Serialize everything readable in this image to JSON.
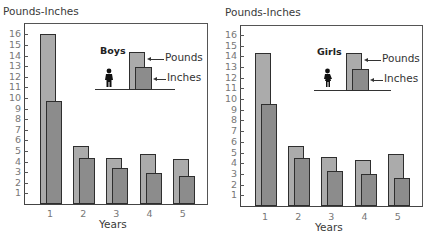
{
  "colors": {
    "pounds": "#ababab",
    "inches": "#8c8c8c",
    "outline": "#2e2e2e"
  },
  "chart_data": [
    {
      "type": "bar",
      "title": "Boys",
      "ylabel": "Pounds-Inches",
      "xlabel": "Years",
      "categories": [
        "1",
        "2",
        "3",
        "4",
        "5"
      ],
      "yticks": [
        1,
        2,
        3,
        4,
        5,
        6,
        7,
        8,
        9,
        10,
        11,
        12,
        13,
        14,
        15,
        16
      ],
      "ylim": [
        0,
        16.6
      ],
      "grid": false,
      "legend_position": "inset top-right",
      "series": [
        {
          "name": "Pounds",
          "values": [
            16.0,
            5.5,
            4.3,
            4.7,
            4.2
          ]
        },
        {
          "name": "Inches",
          "values": [
            9.7,
            4.3,
            3.4,
            2.9,
            2.6
          ]
        }
      ]
    },
    {
      "type": "bar",
      "title": "Girls",
      "ylabel": "Pounds-Inches",
      "xlabel": "Years",
      "categories": [
        "1",
        "2",
        "3",
        "4",
        "5"
      ],
      "yticks": [
        1,
        2,
        3,
        4,
        5,
        6,
        7,
        8,
        9,
        10,
        11,
        12,
        13,
        14,
        15,
        16
      ],
      "ylim": [
        0,
        16.6
      ],
      "grid": false,
      "legend_position": "inset top-right",
      "series": [
        {
          "name": "Pounds",
          "values": [
            14.3,
            5.6,
            4.6,
            4.3,
            4.9
          ]
        },
        {
          "name": "Inches",
          "values": [
            9.5,
            4.5,
            3.3,
            3.0,
            2.6
          ]
        }
      ]
    }
  ],
  "panels": [
    {
      "ylabel": "Pounds-Inches",
      "xlabel": "Years",
      "legend": {
        "title": "Boys",
        "pounds_label": "Pounds",
        "inches_label": "Inches",
        "figure_icon": "boy-silhouette-icon"
      }
    },
    {
      "ylabel": "Pounds-Inches",
      "xlabel": "Years",
      "legend": {
        "title": "Girls",
        "pounds_label": "Pounds",
        "inches_label": "Inches",
        "figure_icon": "girl-silhouette-icon"
      }
    }
  ]
}
